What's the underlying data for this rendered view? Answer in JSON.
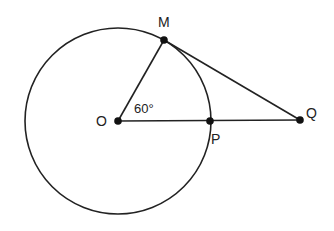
{
  "diagram": {
    "type": "geometry",
    "colors": {
      "stroke": "#222222",
      "background": "#ffffff"
    },
    "circle": {
      "center": "O",
      "cx": 118,
      "cy": 121,
      "r": 93
    },
    "points": {
      "O": {
        "label": "O",
        "x": 118,
        "y": 121
      },
      "M": {
        "label": "M",
        "x": 164,
        "y": 40
      },
      "P": {
        "label": "P",
        "x": 210,
        "y": 121
      },
      "Q": {
        "label": "Q",
        "x": 300,
        "y": 120
      }
    },
    "segments": [
      {
        "from": "O",
        "to": "M"
      },
      {
        "from": "O",
        "to": "Q"
      },
      {
        "from": "M",
        "to": "Q"
      }
    ],
    "angle_label": {
      "text": "60°",
      "vertex": "O",
      "between": [
        "M",
        "P"
      ]
    }
  }
}
